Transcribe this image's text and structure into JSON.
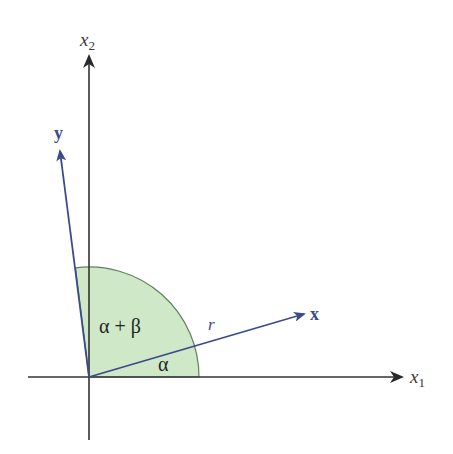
{
  "diagram": {
    "axes": {
      "x1": {
        "label": "x",
        "subscript": "1"
      },
      "x2": {
        "label": "x",
        "subscript": "2"
      }
    },
    "vectors": {
      "x": {
        "label": "x"
      },
      "y": {
        "label": "y"
      }
    },
    "angles": {
      "alpha_plus_beta": "α + β",
      "alpha": "α"
    },
    "magnitude_label": "r",
    "colors": {
      "axis": "#333333",
      "vector": "#3b4a8c",
      "sector_fill": "#cfe8c8",
      "sector_stroke": "#5f7f5f"
    }
  }
}
